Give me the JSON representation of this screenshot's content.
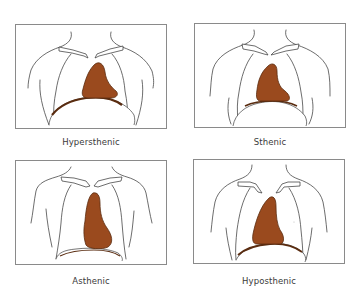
{
  "figure": {
    "type": "anatomical-diagram",
    "colors": {
      "heart_fill": "#9a4a1e",
      "heart_outline": "#5a2c10",
      "outline": "#3c3c3c",
      "frame": "#8a8a8a",
      "label_text": "#3a3a3a",
      "background": "#ffffff"
    },
    "panels": [
      {
        "id": "hypersthenic",
        "label": "Hypersthenic",
        "heart": "broad, transverse, high"
      },
      {
        "id": "sthenic",
        "label": "Sthenic",
        "heart": "moderate, oblique"
      },
      {
        "id": "asthenic",
        "label": "Asthenic",
        "heart": "narrow, vertical, low"
      },
      {
        "id": "hyposthenic",
        "label": "Hyposthenic",
        "heart": "intermediate, vertical"
      }
    ]
  }
}
